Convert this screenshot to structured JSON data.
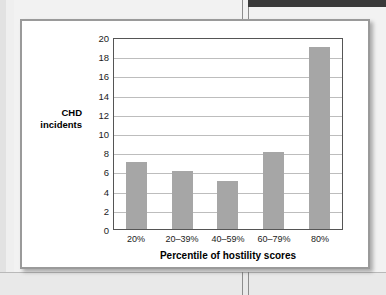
{
  "page": {
    "background_color": "#eeeeee",
    "card_background_color": "#ffffff",
    "card_border_color": "#9a9a9a"
  },
  "chart_data": {
    "type": "bar",
    "title": "",
    "subtitle": "",
    "categories": [
      "20%",
      "20–39%",
      "40–59%",
      "60–79%",
      "80%"
    ],
    "values": [
      7,
      6,
      5,
      8,
      19
    ],
    "series": [
      {
        "name": "CHD incidents",
        "values": [
          7,
          6,
          5,
          8,
          19
        ]
      }
    ],
    "xlabel": "Percentile of hostility scores",
    "ylabel": "CHD incidents",
    "ylabel_line1": "CHD",
    "ylabel_line2": "incidents",
    "ylim": [
      0,
      20
    ],
    "ytick_step": 2,
    "yticks": [
      "20",
      "18",
      "16",
      "14",
      "12",
      "10",
      "8",
      "6",
      "4",
      "2",
      "0"
    ],
    "grid": true,
    "grid_axis": "y",
    "legend": false,
    "legend_position": "none",
    "bar_color": "#a6a6a6",
    "gridline_color": "#bdbdbd",
    "axis_color": "#555555"
  }
}
